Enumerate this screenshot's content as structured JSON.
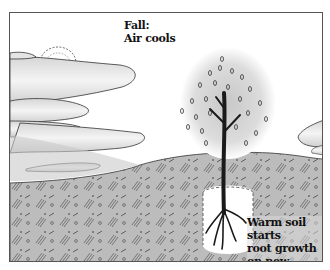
{
  "illustration": {
    "season_title": "Fall:",
    "season_caption": "Air cools",
    "soil_caption_line1": "Warm soil starts",
    "soil_caption_line2": "root growth",
    "soil_caption_line3": "on new plant"
  },
  "colors": {
    "sky": "#ffffff",
    "cloud_shade": "#d0d0d0",
    "ground": "#bdbdbd",
    "outline": "#333333",
    "trunk": "#1a1a1a"
  }
}
